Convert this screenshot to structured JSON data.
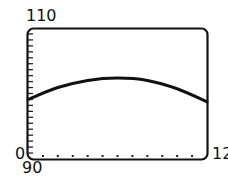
{
  "chart_data": {
    "type": "line",
    "title": "",
    "xlabel": "",
    "ylabel": "",
    "xlim": [
      90,
      120
    ],
    "ylim": [
      0,
      110
    ],
    "x_tick_step": 2.5,
    "y_tick_step": 5,
    "grid": false,
    "axis_labels": {
      "y_max": "110",
      "y_min": "0",
      "x_min": "90",
      "x_max": "12"
    },
    "series": [
      {
        "name": "curve",
        "x": [
          90,
          95,
          100,
          105,
          110,
          115,
          120
        ],
        "values": [
          50,
          60,
          66,
          68,
          66,
          59,
          48
        ]
      }
    ],
    "line_color": "#111111"
  }
}
